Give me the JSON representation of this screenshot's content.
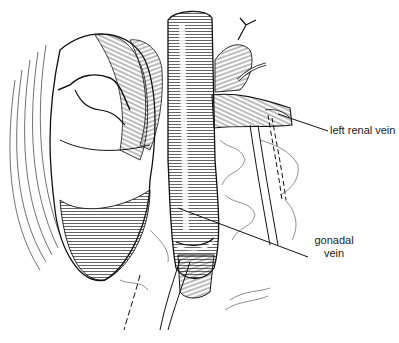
{
  "figure": {
    "type": "anatomical line illustration",
    "labels": [
      {
        "id": "left-renal-vein",
        "text": "left renal vein",
        "x": 330,
        "y": 124,
        "leader_from": [
          278,
          114
        ],
        "leader_to": [
          328,
          131
        ]
      },
      {
        "id": "gonadal-vein",
        "text_line1": "gonadal",
        "text_line2": "vein",
        "x": 312,
        "y": 233,
        "leader_from": [
          178,
          208
        ],
        "leader_to": [
          308,
          257
        ]
      }
    ],
    "colors": {
      "ink": "#1a1a1a",
      "background": "#ffffff"
    }
  }
}
